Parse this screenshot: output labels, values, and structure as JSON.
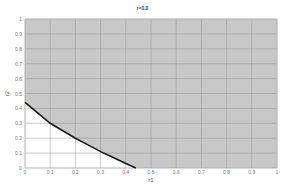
{
  "chart_data": {
    "type": "area",
    "title": "r=0.0",
    "xlabel": "r1",
    "ylabel": "r2",
    "xlim": [
      0,
      1
    ],
    "ylim": [
      0,
      1
    ],
    "grid": true,
    "x_ticks": [
      "0",
      "0.1",
      "0.2",
      "0.3",
      "0.4",
      "0.5",
      "0.6",
      "0.7",
      "0.8",
      "0.9",
      "1"
    ],
    "y_ticks": [
      "0",
      "0.1",
      "0.2",
      "0.3",
      "0.4",
      "0.5",
      "0.6",
      "0.7",
      "0.8",
      "0.9",
      "1"
    ],
    "series": [
      {
        "name": "boundary",
        "x": [
          0,
          0.05,
          0.1,
          0.15,
          0.2,
          0.25,
          0.3,
          0.35,
          0.4,
          0.44
        ],
        "y": [
          0.44,
          0.37,
          0.3,
          0.25,
          0.2,
          0.155,
          0.11,
          0.07,
          0.03,
          0.0
        ]
      }
    ],
    "shaded_region": "above boundary (gray)",
    "unshaded_region": "below boundary (white)"
  },
  "colors": {
    "shade": "#c8c8c8",
    "grid": "#8a8a8a",
    "curve": "#1a1a1a",
    "background": "#ffffff"
  }
}
